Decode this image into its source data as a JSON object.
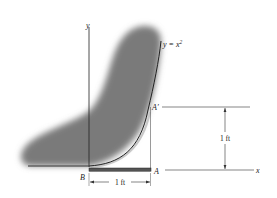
{
  "figure": {
    "curve_equation": "y = x",
    "curve_exponent": "2",
    "axis_y_label": "y",
    "axis_x_label": "x",
    "point_b_label": "B",
    "point_a_label": "A",
    "point_a_prime_label": "A′",
    "dim_horizontal_label": "1 ft",
    "dim_vertical_label": "1 ft",
    "colors": {
      "shading": "#7a7a7a",
      "line": "#222222",
      "bar": "#555555",
      "background": "#ffffff"
    }
  }
}
